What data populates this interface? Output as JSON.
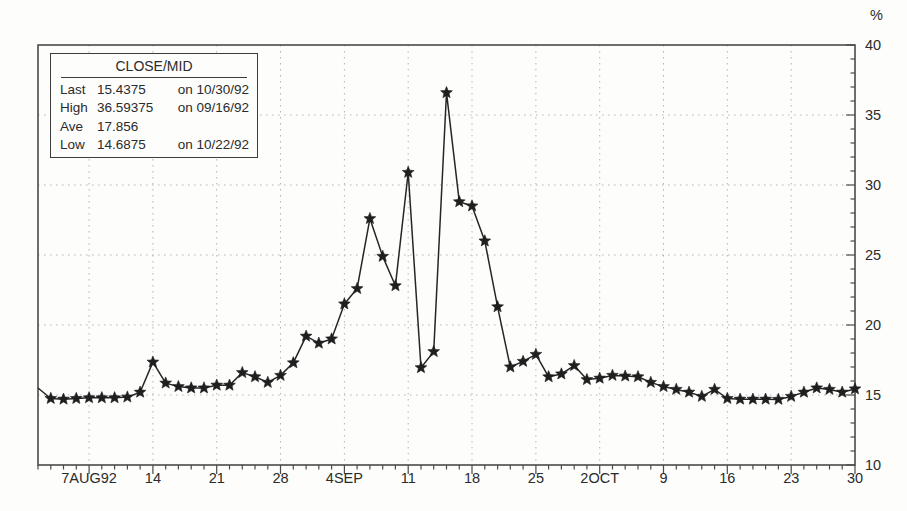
{
  "window": {
    "width": 907,
    "height": 511,
    "background": "#fdfdfc"
  },
  "legend": {
    "title": "CLOSE/MID",
    "rows": [
      {
        "label": "Last",
        "value": "15.4375",
        "date": "on 10/30/92"
      },
      {
        "label": "High",
        "value": "36.59375",
        "date": "on 09/16/92"
      },
      {
        "label": "Ave",
        "value": "17.856",
        "date": ""
      },
      {
        "label": "Low",
        "value": "14.6875",
        "date": "on 10/22/92"
      }
    ]
  },
  "chart_data": {
    "type": "line",
    "title": "",
    "xlabel": "",
    "ylabel": "%",
    "ylim": [
      10,
      40
    ],
    "yticks_major": [
      10,
      15,
      20,
      25,
      30,
      35,
      40
    ],
    "ytick_minor_step": 1,
    "grid": {
      "style": "dotted",
      "horizontal_at": [
        15,
        20,
        25,
        30,
        35
      ]
    },
    "legend_position": "top-left",
    "marker": "star",
    "line_color": "#262626",
    "grid_color": "#b5b5b5",
    "clip_first_marker": true,
    "x_major_tick_indices": [
      4,
      9,
      14,
      19,
      24,
      29,
      34,
      39,
      44,
      49,
      54,
      59,
      64
    ],
    "x_major_tick_labels": [
      "7AUG92",
      "14",
      "21",
      "28",
      "4SEP",
      "11",
      "18",
      "25",
      "2OCT",
      "9",
      "16",
      "23",
      "30"
    ],
    "series": [
      {
        "name": "CLOSE/MID",
        "dates": [
          "08/03",
          "08/04",
          "08/05",
          "08/06",
          "08/07",
          "08/10",
          "08/11",
          "08/12",
          "08/13",
          "08/14",
          "08/17",
          "08/18",
          "08/19",
          "08/20",
          "08/21",
          "08/24",
          "08/25",
          "08/26",
          "08/27",
          "08/28",
          "08/31",
          "09/01",
          "09/02",
          "09/03",
          "09/04",
          "09/07",
          "09/08",
          "09/09",
          "09/10",
          "09/11",
          "09/14",
          "09/15",
          "09/16",
          "09/17",
          "09/18",
          "09/21",
          "09/22",
          "09/23",
          "09/24",
          "09/25",
          "09/28",
          "09/29",
          "09/30",
          "10/01",
          "10/02",
          "10/05",
          "10/06",
          "10/07",
          "10/08",
          "10/09",
          "10/12",
          "10/13",
          "10/14",
          "10/15",
          "10/16",
          "10/19",
          "10/20",
          "10/21",
          "10/22",
          "10/23",
          "10/26",
          "10/27",
          "10/28",
          "10/29",
          "10/30"
        ],
        "values": [
          15.5,
          14.75,
          14.7,
          14.75,
          14.8,
          14.8,
          14.8,
          14.85,
          15.2,
          17.35,
          15.85,
          15.6,
          15.5,
          15.5,
          15.7,
          15.7,
          16.6,
          16.3,
          15.9,
          16.4,
          17.3,
          19.2,
          18.7,
          19.0,
          21.5,
          22.6,
          27.6,
          24.9,
          22.8,
          30.9,
          16.95,
          18.1,
          36.59375,
          28.8,
          28.5,
          26.0,
          21.3,
          17.0,
          17.4,
          17.9,
          16.3,
          16.5,
          17.1,
          16.1,
          16.2,
          16.4,
          16.35,
          16.3,
          15.9,
          15.6,
          15.4,
          15.2,
          14.9,
          15.4,
          14.75,
          14.7,
          14.7,
          14.7,
          14.6875,
          14.9,
          15.2,
          15.5,
          15.4,
          15.2,
          15.4375
        ]
      }
    ],
    "stats": {
      "last": 15.4375,
      "high": 36.59375,
      "ave": 17.856,
      "low": 14.6875
    }
  }
}
